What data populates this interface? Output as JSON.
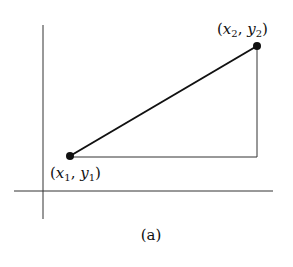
{
  "diagram": {
    "caption": "(a)",
    "points": [
      {
        "id": "p1",
        "label_open": "(",
        "var_x": "x",
        "sub_x": "1",
        "sep": ", ",
        "var_y": "y",
        "sub_y": "1",
        "label_close": ")"
      },
      {
        "id": "p2",
        "label_open": "(",
        "var_x": "x",
        "sub_x": "2",
        "sep": ", ",
        "var_y": "y",
        "sub_y": "2",
        "label_close": ")"
      }
    ],
    "colors": {
      "line": "#111111",
      "axis": "#333333",
      "background": "#ffffff"
    }
  }
}
